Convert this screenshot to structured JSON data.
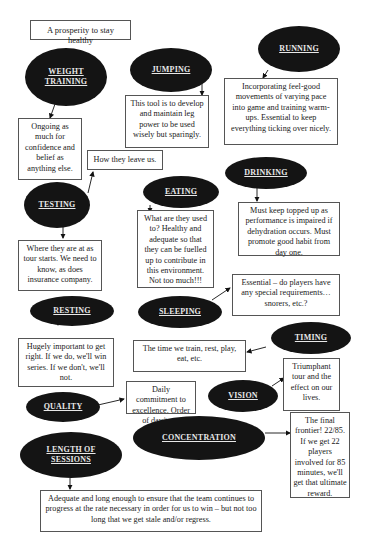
{
  "title": "A prosperity to stay healthy",
  "nodes": {
    "weight_training": {
      "label": "WEIGHT TRAINING",
      "note": "Ongoing as much for confidence and belief as anything else."
    },
    "jumping": {
      "label": "JUMPING",
      "note": "This tool is to develop and maintain leg power to be used wisely but sparingly."
    },
    "running": {
      "label": "RUNNING",
      "note": "Incorporating feel-good movements of varying pace into game and training warm-ups. Essential to keep everything ticking over nicely."
    },
    "testing": {
      "label": "TESTING",
      "note_up": "How they leave us.",
      "note_down": "Where they are at as tour starts. We need to know, as does insurance company."
    },
    "eating": {
      "label": "EATING",
      "note": "What are they used to? Healthy and adequate so that they can be fuelled up to contribute in this environment. Not too much!!!"
    },
    "drinking": {
      "label": "DRINKING",
      "note": "Must keep topped up as performance is impaired if dehydration occurs. Must promote good habit from day one."
    },
    "resting": {
      "label": "RESTING",
      "note": "Hugely important to get right. If we do, we'll win series. If we don't, we'll not."
    },
    "sleeping": {
      "label": "SLEEPING",
      "note": "Essential – do players have any special requirements…snorers, etc.?"
    },
    "timing": {
      "label": "TIMING",
      "note": "The time we train, rest, play, eat, etc."
    },
    "quality": {
      "label": "QUALITY",
      "note": "Daily commitment to excellence. Order of day/tour."
    },
    "vision": {
      "label": "VISION",
      "note": "Triumphant tour and the effect on our lives."
    },
    "length_of_sessions": {
      "label": "LENGTH OF SESSIONS",
      "note": "Adequate and long enough to ensure that the team continues to progress at the rate necessary in order for us to win – but not too long that we get stale and/or regress."
    },
    "concentration": {
      "label": "CONCENTRATION",
      "note": "The final frontier! 22/85. If we get 22 players involved for 85 minutes, we'll get that ultimate reward."
    }
  },
  "colors": {
    "ellipse_fill": "#141414",
    "ellipse_text": "#e8e8e8",
    "box_border": "#555555",
    "background": "#ffffff"
  }
}
